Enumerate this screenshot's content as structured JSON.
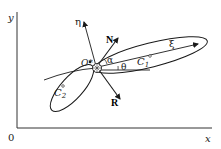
{
  "diagram": {
    "axes": {
      "x_label": "x",
      "y_label": "y",
      "origin_label": "0"
    },
    "labels": {
      "eta": "η",
      "xi": "ξ",
      "N": "N",
      "R": "R",
      "O": "O*",
      "alpha": "α",
      "theta": "θ",
      "C1": "C",
      "C1_sub": "1",
      "C2": "C",
      "C2_sub": "2"
    },
    "colors": {
      "ink": "#1a1a1a",
      "background": "#ffffff"
    }
  }
}
